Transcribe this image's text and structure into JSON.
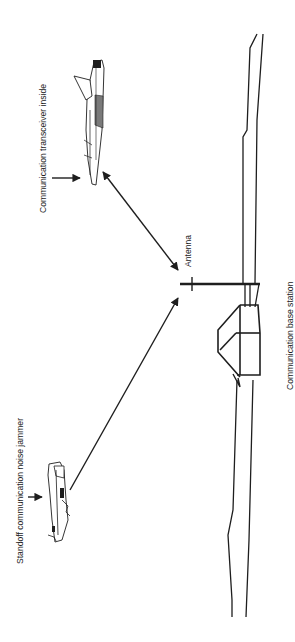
{
  "diagram": {
    "colors": {
      "background": "#ffffff",
      "stroke": "#1e1e1e",
      "text": "#222222",
      "aircraft_shade": "#7a7a7a"
    },
    "labels": {
      "transceiver": "Communication transceiver inside",
      "jammer": "Standoff communication noise jammer",
      "antenna": "Antenna",
      "base_station": "Communication base station"
    },
    "elements": [
      {
        "id": "aircraft-transceiver",
        "icon": "fighter-jet-icon",
        "label_key": "transceiver"
      },
      {
        "id": "aircraft-jammer",
        "icon": "fighter-jet-icon",
        "label_key": "jammer"
      },
      {
        "id": "antenna",
        "icon": "antenna-mast-icon",
        "label_key": "antenna"
      },
      {
        "id": "base-station",
        "icon": "building-icon",
        "label_key": "base_station"
      },
      {
        "id": "link-bidirectional",
        "type": "double-arrow",
        "from": "aircraft-transceiver",
        "to": "antenna"
      },
      {
        "id": "link-jamming",
        "type": "arrow",
        "from": "aircraft-jammer",
        "to": "antenna"
      }
    ],
    "orientation": "rotated 90° clockwise (text reads bottom-to-top)"
  }
}
